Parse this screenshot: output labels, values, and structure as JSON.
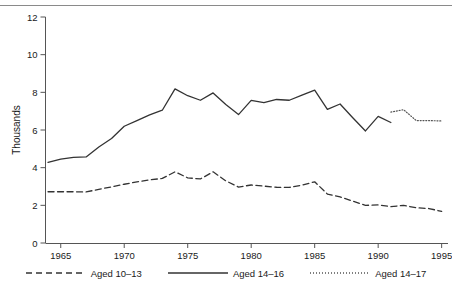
{
  "chart_data": {
    "type": "line",
    "title": "",
    "subtitle": "",
    "xlabel": "",
    "ylabel": "Thousands",
    "xlim": [
      1963.8,
      1995.5
    ],
    "ylim": [
      0,
      12
    ],
    "grid": false,
    "legend_position": "bottom",
    "x_ticks": [
      1965,
      1970,
      1975,
      1980,
      1985,
      1990,
      1995
    ],
    "x_tick_labels": [
      "1965",
      "1970",
      "1975",
      "1980",
      "1985",
      "1990",
      "1995"
    ],
    "y_ticks": [
      0,
      2,
      4,
      6,
      8,
      10,
      12
    ],
    "y_tick_labels": [
      "0",
      "2",
      "4",
      "6",
      "8",
      "10",
      "12"
    ],
    "series": [
      {
        "name": "Aged 10-13",
        "legend_label": "Aged 10–13",
        "style": "dashed",
        "color": "#333333",
        "x": [
          1964,
          1965,
          1966,
          1967,
          1968,
          1969,
          1970,
          1971,
          1972,
          1973,
          1974,
          1975,
          1976,
          1977,
          1978,
          1979,
          1980,
          1981,
          1982,
          1983,
          1984,
          1985,
          1986,
          1987,
          1988,
          1989,
          1990,
          1991,
          1992,
          1993,
          1994,
          1995
        ],
        "values": [
          2.72,
          2.72,
          2.72,
          2.71,
          2.85,
          2.98,
          3.12,
          3.25,
          3.35,
          3.43,
          3.78,
          3.46,
          3.4,
          3.78,
          3.3,
          2.97,
          3.08,
          3.02,
          2.96,
          2.95,
          3.07,
          3.25,
          2.6,
          2.45,
          2.22,
          2.0,
          2.02,
          1.93,
          2.0,
          1.87,
          1.83,
          1.68
        ]
      },
      {
        "name": "Aged 14-16",
        "legend_label": "Aged 14–16",
        "style": "solid",
        "color": "#333333",
        "x": [
          1964,
          1965,
          1966,
          1967,
          1968,
          1969,
          1970,
          1971,
          1972,
          1973,
          1974,
          1975,
          1976,
          1977,
          1978,
          1979,
          1980,
          1981,
          1982,
          1983,
          1984,
          1985,
          1986,
          1987,
          1988,
          1989,
          1990,
          1991
        ],
        "values": [
          4.28,
          4.45,
          4.55,
          4.57,
          5.1,
          5.55,
          6.2,
          6.5,
          6.8,
          7.05,
          8.18,
          7.82,
          7.58,
          7.97,
          7.35,
          6.82,
          7.57,
          7.45,
          7.62,
          7.58,
          7.85,
          8.12,
          7.1,
          7.38,
          6.65,
          5.95,
          6.72,
          6.4
        ]
      },
      {
        "name": "Aged 14-17",
        "legend_label": "Aged 14–17",
        "style": "dotted",
        "color": "#555555",
        "x": [
          1991,
          1992,
          1993,
          1994,
          1995
        ],
        "values": [
          6.95,
          7.08,
          6.5,
          6.5,
          6.48
        ]
      }
    ]
  },
  "axis": {
    "y_title": "Thousands"
  },
  "legend": {
    "entries": [
      {
        "label": "Aged 10–13",
        "style": "dashed"
      },
      {
        "label": "Aged 14–16",
        "style": "solid"
      },
      {
        "label": "Aged 14–17",
        "style": "dotted"
      }
    ]
  }
}
